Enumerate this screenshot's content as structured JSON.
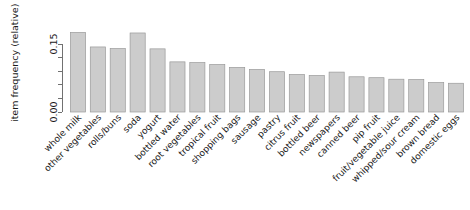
{
  "chart_data": {
    "type": "bar",
    "title": "",
    "subtitle": "",
    "xlabel": "",
    "ylabel": "item frequency (relative)",
    "ylim": [
      0.0,
      0.18
    ],
    "grid": false,
    "legend": null,
    "y_ticks": [
      0.0,
      0.03,
      0.06,
      0.09,
      0.12,
      0.15
    ],
    "y_tick_labels": [
      "0.00",
      "",
      "",
      "",
      "",
      "0.15"
    ],
    "categories": [
      "whole milk",
      "other vegetables",
      "rolls/buns",
      "soda",
      "yogurt",
      "bottled water",
      "root vegetables",
      "tropical fruit",
      "shopping bags",
      "sausage",
      "pastry",
      "citrus fruit",
      "bottled beer",
      "newspapers",
      "canned beer",
      "pip fruit",
      "fruit/vegetable juice",
      "whipped/sour cream",
      "brown bread",
      "domestic eggs"
    ],
    "values": [
      0.1755,
      0.1435,
      0.1399,
      0.1743,
      0.1393,
      0.1106,
      0.1089,
      0.1049,
      0.0985,
      0.094,
      0.0889,
      0.0828,
      0.0805,
      0.088,
      0.0777,
      0.0757,
      0.0723,
      0.0717,
      0.0649,
      0.0634
    ],
    "bar_fill_color": "#cccccc",
    "bar_border_color": "#9a9a9a",
    "axis_color": "#4d4d4d",
    "background_color": "#ffffff",
    "x_label_rotation_deg": -45
  }
}
